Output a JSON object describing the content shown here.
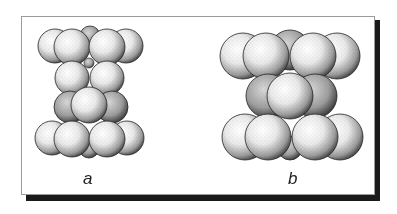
{
  "figure": {
    "panels": [
      {
        "id": "a",
        "label": "a",
        "description": "Sphere packing arrangement, narrower stack with 4 layers"
      },
      {
        "id": "b",
        "label": "b",
        "description": "Sphere packing arrangement, wider stack with 3 layers"
      }
    ],
    "colors": {
      "frame_border": "#9a9a9a",
      "shadow": "#1a1a1a",
      "sphere_dark": "#222222",
      "sphere_light": "#ffffff"
    }
  }
}
